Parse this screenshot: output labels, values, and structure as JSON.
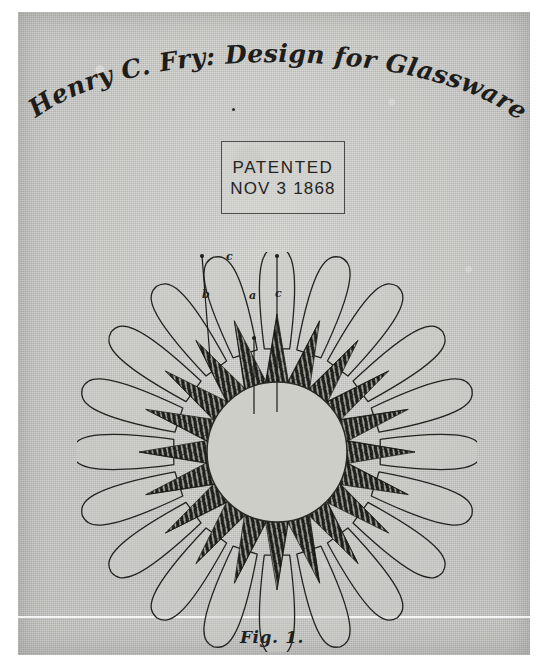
{
  "document": {
    "kind": "patent-drawing-scan",
    "title_script": "Henry C. Fry: Design for Glassware",
    "figure_caption": "Fig. 1.",
    "paper_color": "#c8c8c5",
    "ink_color": "#1d1d1c"
  },
  "stamp": {
    "line1": "PATENTED",
    "line2": "NOV  3 1868"
  },
  "reference_labels": [
    {
      "text": "b",
      "x": 52,
      "y": 49
    },
    {
      "text": "c",
      "x": 76,
      "y": 11
    },
    {
      "text": "a",
      "x": 99,
      "y": 50
    },
    {
      "text": "c",
      "x": 125,
      "y": 48
    }
  ],
  "drawing": {
    "type": "rosette",
    "description": "Circular glassware design: ring of rounded outer petals, inner band of dark cross-hatched radiating star points, plain circular center",
    "outer_petal_count": 20,
    "star_ray_count": 20,
    "center": {
      "cx": 200,
      "cy": 200
    },
    "radii": {
      "petal_tip": 196,
      "petal_base": 104,
      "star_tip": 138,
      "star_valley": 72,
      "center_circle": 70
    },
    "colors": {
      "outline": "#23231f",
      "petal_fill": "#cbcbc7",
      "hatch_dark": "#1b1b17",
      "center_fill": "#cecec9"
    }
  },
  "leaders": [
    {
      "from": {
        "x": 52,
        "y": 16
      },
      "to": {
        "x": 60,
        "y": 118
      }
    },
    {
      "from": {
        "x": 127,
        "y": 16
      },
      "to": {
        "x": 127,
        "y": 172
      }
    },
    {
      "from": {
        "x": 104,
        "y": 98
      },
      "to": {
        "x": 104,
        "y": 174
      }
    }
  ]
}
